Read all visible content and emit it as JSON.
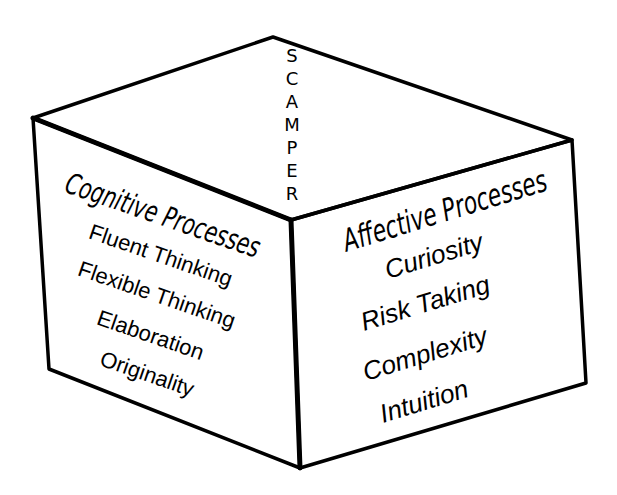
{
  "diagram": {
    "type": "cube",
    "top_face": {
      "label": "SCAMPER",
      "letters": [
        "S",
        "C",
        "A",
        "M",
        "P",
        "E",
        "R"
      ]
    },
    "left_face": {
      "title": "Cognitive Processes",
      "items": [
        "Fluent Thinking",
        "Flexible Thinking",
        "Elaboration",
        "Originality"
      ]
    },
    "right_face": {
      "title": "Affective Processes",
      "items": [
        "Curiosity",
        "Risk Taking",
        "Complexity",
        "Intuition"
      ]
    },
    "colors": {
      "stroke": "#000000",
      "background": "#ffffff"
    }
  }
}
